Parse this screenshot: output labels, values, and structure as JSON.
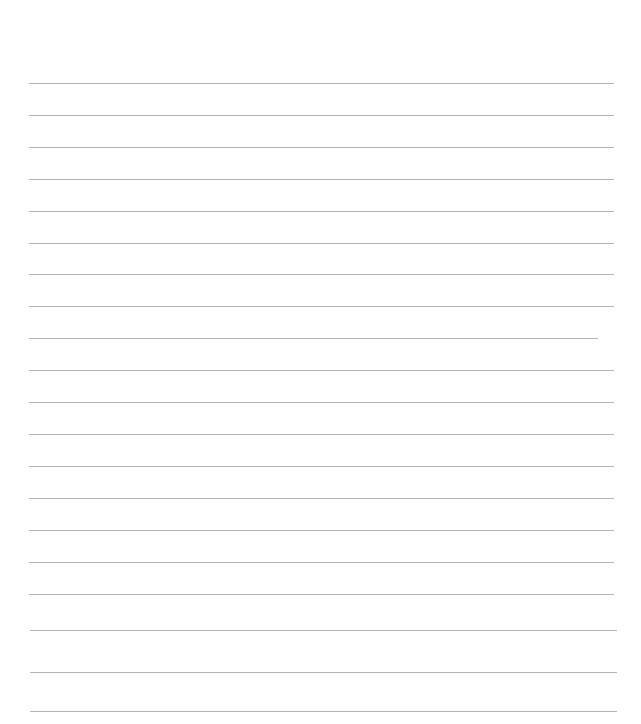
{
  "paper": {
    "background": "#fefefe",
    "line_color": "#b4b4b4",
    "lines": [
      {
        "y": 83,
        "x1": 29,
        "x2": 614
      },
      {
        "y": 115,
        "x1": 29,
        "x2": 614
      },
      {
        "y": 147,
        "x1": 29,
        "x2": 614
      },
      {
        "y": 179,
        "x1": 29,
        "x2": 614
      },
      {
        "y": 211,
        "x1": 29,
        "x2": 614
      },
      {
        "y": 243,
        "x1": 29,
        "x2": 614
      },
      {
        "y": 274,
        "x1": 29,
        "x2": 614
      },
      {
        "y": 306,
        "x1": 29,
        "x2": 614
      },
      {
        "y": 338,
        "x1": 29,
        "x2": 598
      },
      {
        "y": 370,
        "x1": 29,
        "x2": 614
      },
      {
        "y": 402,
        "x1": 29,
        "x2": 614
      },
      {
        "y": 434,
        "x1": 29,
        "x2": 614
      },
      {
        "y": 466,
        "x1": 29,
        "x2": 614
      },
      {
        "y": 498,
        "x1": 29,
        "x2": 614
      },
      {
        "y": 530,
        "x1": 29,
        "x2": 614
      },
      {
        "y": 562,
        "x1": 29,
        "x2": 614
      },
      {
        "y": 594,
        "x1": 29,
        "x2": 614
      },
      {
        "y": 630,
        "x1": 30,
        "x2": 617
      },
      {
        "y": 672,
        "x1": 30,
        "x2": 617
      },
      {
        "y": 711,
        "x1": 30,
        "x2": 617
      }
    ]
  }
}
